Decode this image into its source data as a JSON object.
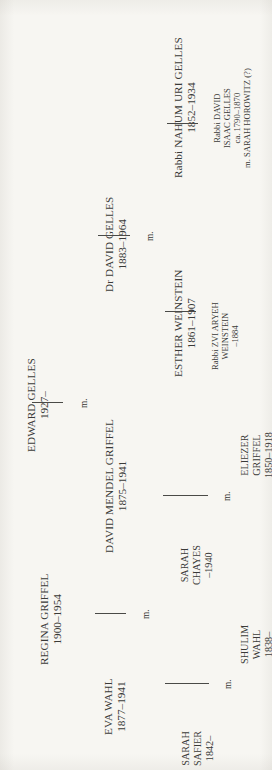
{
  "chart": {
    "type": "genealogy-tree",
    "orientation": "rotated-90-ccw",
    "background_color": "#f7f6f2",
    "text_color": "#3a3a38",
    "line_color": "#4a4a47",
    "marriage_label": "m."
  },
  "people": {
    "edward_gelles": {
      "name": "EDWARD GELLES",
      "dates": "1927–"
    },
    "dr_david_gelles": {
      "name": "Dr DAVID GELLES",
      "dates": "1883–1964"
    },
    "nahum_uri_gelles": {
      "name": "Rabbi NAHUM URI GELLES",
      "dates": "1852–1934"
    },
    "david_isaac_gelles": {
      "line1": "Rabbi DAVID",
      "line2": "ISAAC GELLES",
      "line3": "ca. 1790–1870",
      "line4": "m. SARAH HOROWITZ (?)"
    },
    "esther_weinstein": {
      "name": "ESTHER WEINSTEIN",
      "dates": "1861–1907"
    },
    "zvi_aryeh_weinstein": {
      "line1": "Rabbi ZVI ARYEH",
      "line2": "WEINSTEIN",
      "line3": "–1884"
    },
    "regina_griffel": {
      "name": "REGINA GRIFFEL",
      "dates": "1900–1954"
    },
    "david_mendel_griffel": {
      "name": "DAVID MENDEL GRIFFEL",
      "dates": "1875–1941"
    },
    "eliezer_griffel": {
      "line1": "ELIEZER",
      "line2": "GRIFFEL",
      "line3": "1850–1918"
    },
    "sarah_chayes": {
      "line1": "SARAH",
      "line2": "CHAYES",
      "line3": "–1940"
    },
    "eva_wahl": {
      "name": "EVA WAHL",
      "dates": "1877–1941"
    },
    "shulim_wahl": {
      "line1": "SHULIM",
      "line2": "WAHL",
      "line3": "1838–"
    },
    "sarah_safier": {
      "line1": "SARAH",
      "line2": "SAFIER",
      "line3": "1842–"
    }
  },
  "marriages": [
    {
      "id": "edward-gelles-marriage",
      "label": "m."
    },
    {
      "id": "dr-david-gelles-marriage",
      "label": "m."
    },
    {
      "id": "nahum-uri-gelles-descent",
      "label": ""
    },
    {
      "id": "esther-weinstein-descent",
      "label": ""
    },
    {
      "id": "regina-griffel-marriage",
      "label": "m."
    },
    {
      "id": "david-mendel-griffel-marriage",
      "label": "m."
    },
    {
      "id": "eva-wahl-marriage",
      "label": "m."
    }
  ]
}
